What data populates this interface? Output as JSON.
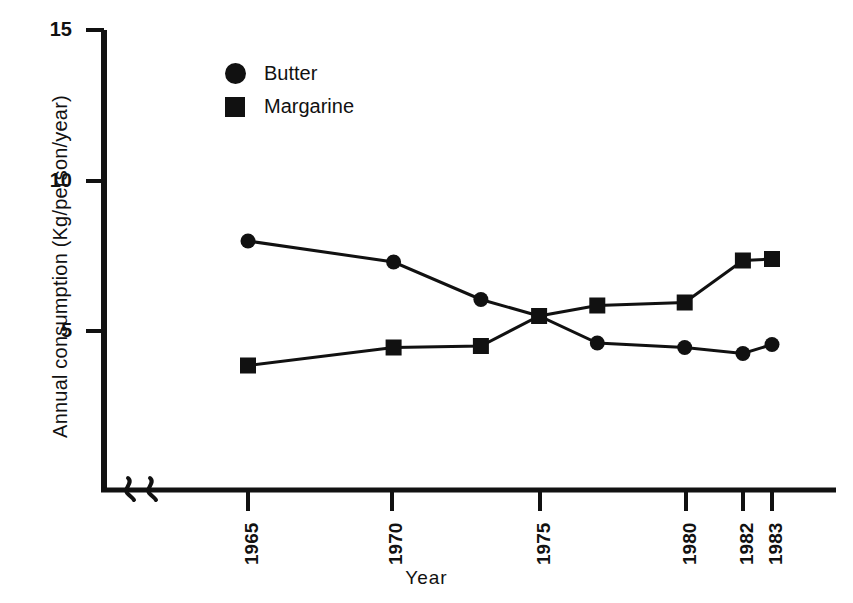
{
  "chart_data": {
    "type": "line",
    "title": "",
    "xlabel": "Year",
    "ylabel": "Annual consumption (Kg/person/year)",
    "x": [
      1965,
      1970,
      1973,
      1975,
      1977,
      1980,
      1982,
      1983
    ],
    "xtick_labels": [
      "1965",
      "1970",
      "1975",
      "1980",
      "1982",
      "1983"
    ],
    "xtick_values": [
      1965,
      1970,
      1975,
      1980,
      1982,
      1983
    ],
    "ytick_labels": [
      "5",
      "10",
      "15"
    ],
    "ytick_values": [
      5,
      10,
      15
    ],
    "xlim": [
      1963.5,
      1985.5
    ],
    "ylim": [
      0,
      15
    ],
    "grid": false,
    "legend_position": "top-left",
    "axis_break": "x-axis-origin",
    "series": [
      {
        "name": "Butter",
        "marker": "circle",
        "color": "#111111",
        "values": [
          8.0,
          7.3,
          6.05,
          5.5,
          4.6,
          4.45,
          4.25,
          4.55
        ]
      },
      {
        "name": "Margarine",
        "marker": "square",
        "color": "#111111",
        "values": [
          3.85,
          4.45,
          4.5,
          5.5,
          5.85,
          5.95,
          7.35,
          7.4
        ]
      }
    ]
  },
  "legend": {
    "items": [
      {
        "label": "Butter",
        "marker": "circle-marker-icon"
      },
      {
        "label": "Margarine",
        "marker": "square-marker-icon"
      }
    ]
  },
  "axes": {
    "y_title": "Annual consumption (Kg/person/year)",
    "x_title": "Year",
    "y_ticks": [
      "15",
      "10",
      "5"
    ],
    "x_ticks": [
      "1965",
      "1970",
      "1975",
      "1980",
      "1982",
      "1983"
    ]
  },
  "colors": {
    "ink": "#111111",
    "background": "#ffffff"
  }
}
